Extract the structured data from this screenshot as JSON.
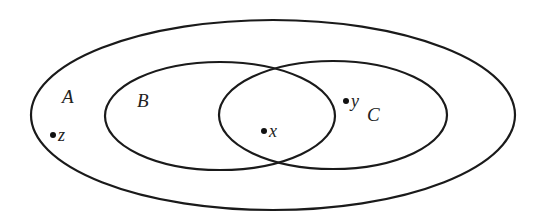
{
  "diagram": {
    "type": "venn",
    "sets": [
      {
        "id": "A",
        "label": "A",
        "cx": 273,
        "cy": 115,
        "rx": 242,
        "ry": 95,
        "label_x": 62,
        "label_y": 103
      },
      {
        "id": "B",
        "label": "B",
        "cx": 220,
        "cy": 116,
        "rx": 115,
        "ry": 54,
        "label_x": 137,
        "label_y": 107
      },
      {
        "id": "C",
        "label": "C",
        "cx": 333,
        "cy": 115,
        "rx": 114,
        "ry": 54,
        "label_x": 367,
        "label_y": 121
      }
    ],
    "points": [
      {
        "id": "z",
        "label": "z",
        "cx": 53,
        "cy": 135,
        "label_x": 58,
        "label_y": 141,
        "region": "A only"
      },
      {
        "id": "x",
        "label": "x",
        "cx": 264,
        "cy": 131,
        "label_x": 269,
        "label_y": 137,
        "region": "B ∩ C"
      },
      {
        "id": "y",
        "label": "y",
        "cx": 346,
        "cy": 101,
        "label_x": 351,
        "label_y": 107,
        "region": "C only"
      }
    ],
    "stroke_color": "#1a1a1a",
    "background": "#ffffff"
  }
}
